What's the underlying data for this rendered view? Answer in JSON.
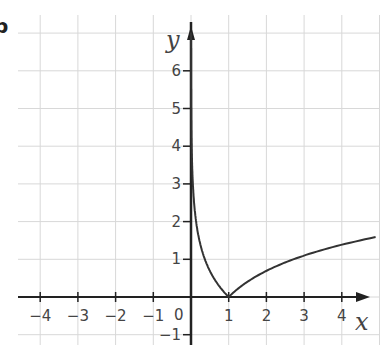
{
  "figure": {
    "part_marker": "b"
  },
  "chart_data": {
    "type": "line",
    "title": "",
    "function": "y = |ln x|",
    "xlabel": "x",
    "ylabel": "y",
    "xlim": [
      -4.5,
      5
    ],
    "ylim": [
      -1.2,
      7
    ],
    "grid": true,
    "x_ticks": [
      -4,
      -3,
      -2,
      -1,
      1,
      2,
      3,
      4
    ],
    "y_ticks": [
      -1,
      1,
      2,
      3,
      4,
      5,
      6
    ],
    "origin_label": "0",
    "series": [
      {
        "name": "|ln x|",
        "x": [
          0.001,
          0.05,
          0.1,
          0.2,
          0.3,
          0.5,
          0.7,
          1,
          1.5,
          2,
          2.5,
          3,
          3.5,
          4,
          4.5
        ],
        "y": [
          6.9,
          3.0,
          2.3,
          1.61,
          1.2,
          0.69,
          0.36,
          0,
          0.41,
          0.69,
          0.92,
          1.1,
          1.25,
          1.39,
          1.5
        ]
      }
    ],
    "colors": {
      "curve": "#333333",
      "axis": "#222222",
      "grid": "#d8d8d8"
    }
  }
}
